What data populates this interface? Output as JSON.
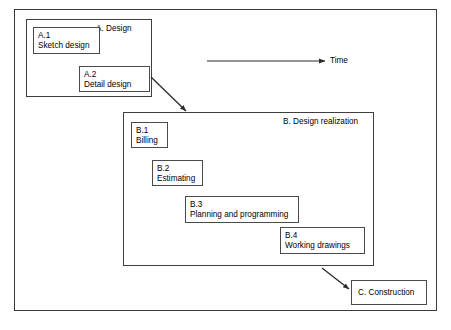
{
  "diagram": {
    "background_color": "#ffffff",
    "line_color": "#3a3a3a",
    "text_color": "#111111",
    "outer_frame": {
      "x": 14,
      "y": 9,
      "width": 423,
      "height": 302
    },
    "time_axis": {
      "label": "Time",
      "arrow_from_x": 207,
      "arrow_to_x": 325,
      "y": 61,
      "label_x": 330,
      "label_y": 56
    },
    "groups": [
      {
        "id": "A",
        "label": "A.  Design",
        "x": 26,
        "y": 19,
        "width": 126,
        "height": 78,
        "label_x": 96,
        "label_y": 24
      },
      {
        "id": "B",
        "label": "B.  Design realization",
        "x": 123,
        "y": 112,
        "width": 251,
        "height": 154,
        "label_x": 283,
        "label_y": 117
      }
    ],
    "boxes": [
      {
        "id": "A.1",
        "code": "A.1",
        "text": "Sketch design",
        "x": 33,
        "y": 27,
        "width": 67,
        "height": 27
      },
      {
        "id": "A.2",
        "code": "A.2",
        "text": "Detail design",
        "x": 79,
        "y": 66,
        "width": 71,
        "height": 26
      },
      {
        "id": "B.1",
        "code": "B.1",
        "text": "Billing",
        "x": 131,
        "y": 122,
        "width": 37,
        "height": 26
      },
      {
        "id": "B.2",
        "code": "B.2",
        "text": "Estimating",
        "x": 152,
        "y": 160,
        "width": 51,
        "height": 26
      },
      {
        "id": "B.3",
        "code": "B.3",
        "text": "Planning and programming",
        "x": 185,
        "y": 196,
        "width": 114,
        "height": 27
      },
      {
        "id": "B.4",
        "code": "B.4",
        "text": "Working drawings",
        "x": 280,
        "y": 227,
        "width": 85,
        "height": 27
      }
    ],
    "single_boxes": [
      {
        "id": "C",
        "label": "C.  Construction",
        "x": 351,
        "y": 280,
        "width": 76,
        "height": 25
      }
    ],
    "arrows": [
      {
        "id": "a2-to-b",
        "from_x": 151,
        "from_y": 77,
        "to_x": 186,
        "to_y": 111
      },
      {
        "id": "b-to-c",
        "from_x": 322,
        "from_y": 268,
        "to_x": 349,
        "to_y": 289
      }
    ]
  }
}
